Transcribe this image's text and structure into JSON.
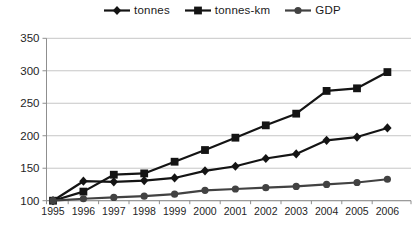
{
  "chart_data": {
    "type": "line",
    "title": "",
    "xlabel": "",
    "ylabel": "",
    "x": [
      1995,
      1996,
      1997,
      1998,
      1999,
      2000,
      2001,
      2002,
      2003,
      2004,
      2005,
      2006
    ],
    "ylim": [
      100,
      350
    ],
    "yticks": [
      100,
      150,
      200,
      250,
      300,
      350
    ],
    "grid": true,
    "legend_position": "top-center",
    "series": [
      {
        "name": "tonnes",
        "marker": "diamond",
        "color": "#141414",
        "values": [
          100,
          130,
          129,
          131,
          135,
          146,
          153,
          165,
          172,
          193,
          198,
          212
        ]
      },
      {
        "name": "tonnes-km",
        "marker": "square",
        "color": "#141414",
        "values": [
          100,
          114,
          140,
          142,
          160,
          178,
          197,
          216,
          234,
          269,
          273,
          298
        ]
      },
      {
        "name": "GDP",
        "marker": "circle",
        "color": "#424242",
        "values": [
          100,
          103,
          105,
          107,
          110,
          116,
          118,
          120,
          122,
          125,
          128,
          133
        ]
      }
    ],
    "axis_color": "#8f8f8f",
    "grid_color": "#c6c6c6",
    "tick_label_color": "#1f1f1f"
  }
}
